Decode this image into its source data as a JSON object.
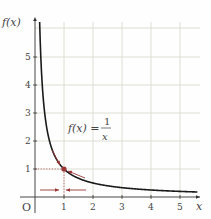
{
  "chart_data": {
    "type": "line",
    "title": "",
    "xlabel": "x",
    "ylabel": "f(x)",
    "origin_label": "O",
    "x_ticks": [
      1,
      2,
      3,
      4,
      5
    ],
    "y_ticks": [
      1,
      2,
      3,
      4,
      5
    ],
    "xlim": [
      0,
      5.6
    ],
    "ylim": [
      0,
      6.2
    ],
    "grid": true,
    "series": [
      {
        "name": "f(x) = 1/x",
        "function": "1/x",
        "x": [
          0.16,
          0.2,
          0.25,
          0.33,
          0.5,
          0.75,
          1,
          1.5,
          2,
          2.5,
          3,
          3.5,
          4,
          4.5,
          5,
          5.5
        ],
        "values": [
          6.25,
          5,
          4,
          3,
          2,
          1.33,
          1,
          0.67,
          0.5,
          0.4,
          0.33,
          0.29,
          0.25,
          0.22,
          0.2,
          0.18
        ]
      }
    ],
    "annotations": {
      "equation": {
        "lhs": "f(x) =",
        "numerator": "1",
        "denominator": "x"
      },
      "highlight_point": {
        "x": 1,
        "y": 1
      },
      "arrows": [
        "arrow along curve approaching (1,1) from the left/above",
        "arrow along curve approaching (1,1) from the right/below",
        "arrow on x-axis approaching x=1 from the left",
        "arrow on x-axis approaching x=1 from the right"
      ]
    }
  },
  "colors": {
    "curve": "#1a1a1a",
    "grid": "#d8d8cc",
    "axis": "#333333",
    "accent": "#9b3535",
    "label": "#444444"
  }
}
